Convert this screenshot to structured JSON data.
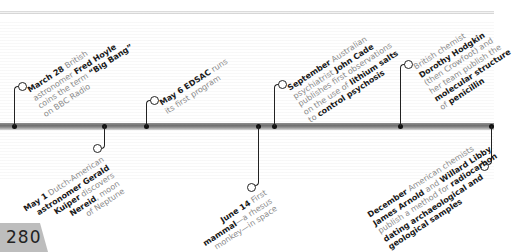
{
  "page": {
    "number": "280"
  },
  "events_above": [
    {
      "id": "march28",
      "parts": [
        {
          "t": "March 28",
          "b": true
        },
        {
          "t": " British",
          "b": false
        },
        {
          "br": true
        },
        {
          "t": "astronomer ",
          "b": false
        },
        {
          "t": "Fred Hoyle",
          "b": true
        },
        {
          "br": true
        },
        {
          "t": "coins the term ",
          "b": false
        },
        {
          "t": "“Big Bang”",
          "b": true
        },
        {
          "br": true
        },
        {
          "t": "on BBC Radio",
          "b": false
        }
      ]
    },
    {
      "id": "may6",
      "parts": [
        {
          "t": "May 6",
          "b": true
        },
        {
          "t": " ",
          "b": false
        },
        {
          "t": "EDSAC",
          "b": true
        },
        {
          "t": " runs",
          "b": false
        },
        {
          "br": true
        },
        {
          "t": "its first program",
          "b": false
        }
      ]
    },
    {
      "id": "september",
      "parts": [
        {
          "t": "September",
          "b": true
        },
        {
          "t": " Australian",
          "b": false
        },
        {
          "br": true
        },
        {
          "t": "psychiatrist ",
          "b": false
        },
        {
          "t": "John Cade",
          "b": true
        },
        {
          "br": true
        },
        {
          "t": "publishes first observations",
          "b": false
        },
        {
          "br": true
        },
        {
          "t": "on the use of ",
          "b": false
        },
        {
          "t": "lithium salts",
          "b": true
        },
        {
          "br": true
        },
        {
          "t": "to ",
          "b": false
        },
        {
          "t": "control psychosis",
          "b": true
        }
      ]
    },
    {
      "id": "hodgkin",
      "parts": [
        {
          "t": "British chemist",
          "b": false
        },
        {
          "br": true
        },
        {
          "t": "Dorothy Hodgkin",
          "b": true
        },
        {
          "br": true
        },
        {
          "t": "(then Crowfoot) and",
          "b": false
        },
        {
          "br": true
        },
        {
          "t": "her team publish the",
          "b": false
        },
        {
          "br": true
        },
        {
          "t": "molecular structure",
          "b": true
        },
        {
          "br": true
        },
        {
          "t": "of ",
          "b": false
        },
        {
          "t": "penicillin",
          "b": true
        }
      ]
    }
  ],
  "events_below": [
    {
      "id": "may1",
      "parts": [
        {
          "t": "May 1",
          "b": true
        },
        {
          "t": " Dutch-American",
          "b": false
        },
        {
          "br": true
        },
        {
          "t": "astronomer Gerald",
          "b": true
        },
        {
          "br": true
        },
        {
          "t": "Kuiper",
          "b": true
        },
        {
          "t": " discovers",
          "b": false
        },
        {
          "br": true
        },
        {
          "t": "Nereid",
          "b": true
        },
        {
          "t": ", moon",
          "b": false
        },
        {
          "br": true
        },
        {
          "t": "of Neptune",
          "b": false
        }
      ]
    },
    {
      "id": "june14",
      "parts": [
        {
          "t": "June 14",
          "b": true
        },
        {
          "t": " First",
          "b": false
        },
        {
          "br": true
        },
        {
          "t": "mammal",
          "b": true
        },
        {
          "t": "—a rhesus",
          "b": false
        },
        {
          "br": true
        },
        {
          "t": "monkey—in space",
          "b": false
        }
      ]
    },
    {
      "id": "december",
      "parts": [
        {
          "t": "December",
          "b": true
        },
        {
          "t": " American chemists",
          "b": false
        },
        {
          "br": true
        },
        {
          "t": "James Arnold",
          "b": true
        },
        {
          "t": " and ",
          "b": false
        },
        {
          "t": "Willard Libby",
          "b": true
        },
        {
          "br": true
        },
        {
          "t": "publish a method for ",
          "b": false
        },
        {
          "t": "radiocarbon",
          "b": true
        },
        {
          "br": true
        },
        {
          "t": "dating archaeological and",
          "b": true
        },
        {
          "br": true
        },
        {
          "t": "geological samples",
          "b": true
        }
      ]
    }
  ]
}
